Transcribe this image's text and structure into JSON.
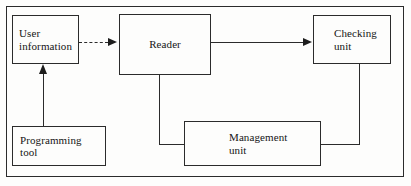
{
  "figure": {
    "type": "block-diagram",
    "frame": {
      "label": "diagram-border"
    },
    "nodes": [
      {
        "id": "user-information",
        "label": "User\ninformation"
      },
      {
        "id": "reader",
        "label": "Reader"
      },
      {
        "id": "checking-unit",
        "label": "Checking\nunit"
      },
      {
        "id": "programming-tool",
        "label": "Programming\ntool"
      },
      {
        "id": "management-unit",
        "label": "Management\nunit"
      }
    ],
    "connectors": [
      {
        "id": "user-information-to-reader",
        "from": "user-information",
        "to": "reader",
        "style": "dashed",
        "arrow": "right"
      },
      {
        "id": "reader-to-checking-unit",
        "from": "reader",
        "to": "checking-unit",
        "style": "solid",
        "arrow": "right"
      },
      {
        "id": "programming-tool-to-user-information",
        "from": "programming-tool",
        "to": "user-information",
        "style": "solid",
        "arrow": "up"
      },
      {
        "id": "reader-to-management-unit",
        "from": "reader",
        "to": "management-unit",
        "style": "solid",
        "arrow": "none"
      },
      {
        "id": "checking-unit-to-management-unit",
        "from": "checking-unit",
        "to": "management-unit",
        "style": "solid",
        "arrow": "none"
      }
    ],
    "colors": {
      "stroke": "#2b2b2b",
      "text": "#151515",
      "background": "#fdfdfc"
    }
  }
}
